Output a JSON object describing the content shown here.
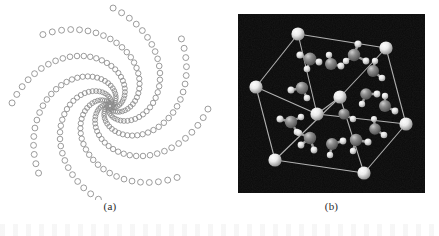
{
  "figure": {
    "background_color": "#ffffff",
    "width": 439,
    "height": 236
  },
  "panels": [
    {
      "id": "a",
      "label": "(a)",
      "kind": "spiral-lattice-diagram",
      "description": "Spiral phyllotaxis arrangement of small open circles",
      "background_color": "#ffffff",
      "marker_stroke_color": "#8a8a8a",
      "marker_fill": "none",
      "arm_count": 8,
      "center": {
        "x": 110,
        "y": 106
      },
      "markers_per_arm": 34,
      "handedness": "counterclockwise",
      "inner_radius": 3,
      "outer_radius": 98,
      "inner_marker_radius": 1.8,
      "outer_marker_radius": 3.0,
      "arm_twist_turns": 0.62
    },
    {
      "id": "b",
      "label": "(b)",
      "kind": "crystal-unit-cell-render",
      "description": "Ball-and-stick rendering of a molecular crystal unit cell inside a wireframe cube",
      "background_color": "#0a0a0a",
      "cell_edge_color": "#c9c9c9",
      "corner_atom_color": "#f2f2f2",
      "heavy_atom_color": "#7d7d7d",
      "light_atom_color": "#e9e9e9",
      "bond_color": "#9a9a9a",
      "corner_atom_count": 8,
      "cube_vertices_2d": [
        {
          "name": "top-back",
          "x": 60,
          "y": 20
        },
        {
          "name": "top-right",
          "x": 148,
          "y": 34
        },
        {
          "name": "mid-right",
          "x": 168,
          "y": 110
        },
        {
          "name": "mid-front",
          "x": 79,
          "y": 100
        },
        {
          "name": "left-upper",
          "x": 18,
          "y": 73
        },
        {
          "name": "bot-left",
          "x": 37,
          "y": 146
        },
        {
          "name": "bot-front",
          "x": 126,
          "y": 159
        },
        {
          "name": "bot-center",
          "x": 102,
          "y": 83
        }
      ]
    }
  ],
  "captions": {
    "panel_a": "(a)",
    "panel_b": "(b)"
  }
}
